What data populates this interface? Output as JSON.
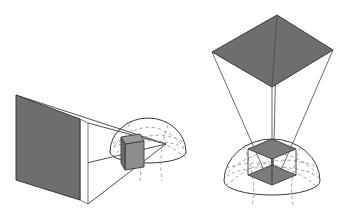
{
  "figure": {
    "background_color": "#ffffff",
    "width": 347,
    "height": 213,
    "panels": [
      {
        "id": "left-panel",
        "name": "side-view-frustum",
        "caption": "",
        "description": "Side view: image plane at left, viewing frustum converging right into a hemispherical scene volume containing a small box.",
        "image_plane": {
          "name": "image-plane-quad",
          "fill": "#6e6e6e",
          "stroke": "#3a3a3a",
          "points": "16,95 80,119 80,200 16,180"
        },
        "image_plane_edge": {
          "name": "image-plane-thickness",
          "fill": "#fbfbfb",
          "stroke": "#555555",
          "points": "80,119 88,123 88,204 80,200"
        },
        "apex": {
          "name": "frustum-apex",
          "x": 166,
          "y": 144
        },
        "frustum_rays": [
          {
            "name": "frustum-ray-top-left",
            "x1": 16,
            "y1": 95,
            "x2": 166,
            "y2": 144
          },
          {
            "name": "frustum-ray-top-right",
            "x1": 88,
            "y1": 123,
            "x2": 166,
            "y2": 144
          },
          {
            "name": "frustum-ray-bot-left",
            "x1": 16,
            "y1": 180,
            "x2": 166,
            "y2": 144
          },
          {
            "name": "frustum-ray-bot-right",
            "x1": 88,
            "y1": 204,
            "x2": 166,
            "y2": 144
          }
        ],
        "hemisphere": {
          "name": "scene-hemisphere",
          "stroke": "#3a3a3a",
          "dash_stroke": "#8a8a8a",
          "center_x": 148,
          "center_y": 152,
          "radius_x": 38,
          "radius_y": 34,
          "base_ellipse_ry": 11
        },
        "box": {
          "name": "scene-box",
          "fill": "#7b7b7b",
          "stroke": "#3a3a3a",
          "top_face": "121,137 140,134 144,141 125,144",
          "front_face": "121,137 125,144 125,170 121,163",
          "side_face": "125,144 144,141 144,167 125,170"
        }
      },
      {
        "id": "right-panel",
        "name": "top-view-frustum",
        "caption": "",
        "description": "Top-down view: image plane above, rays converging down onto a hemispherical scene volume containing an upright box.",
        "image_plane": {
          "name": "image-plane-quad",
          "fill": "#6e6e6e",
          "stroke": "#3a3a3a",
          "points": "277,15 333,50 272,87 212,52"
        },
        "apex": {
          "name": "frustum-apex",
          "x": 272,
          "y": 185
        },
        "frustum_rays": [
          {
            "name": "frustum-ray-corner-top",
            "x1": 277,
            "y1": 15,
            "x2": 273,
            "y2": 184
          },
          {
            "name": "frustum-ray-corner-right",
            "x1": 333,
            "y1": 50,
            "x2": 275,
            "y2": 184
          },
          {
            "name": "frustum-ray-corner-bottom",
            "x1": 272,
            "y1": 87,
            "x2": 272,
            "y2": 184
          },
          {
            "name": "frustum-ray-corner-left",
            "x1": 212,
            "y1": 52,
            "x2": 270,
            "y2": 184
          }
        ],
        "hemisphere": {
          "name": "scene-hemisphere",
          "stroke": "#3a3a3a",
          "dash_stroke": "#8a8a8a",
          "center_x": 272,
          "center_y": 181,
          "radius_x": 48,
          "radius_y": 42,
          "base_ellipse_ry": 14
        },
        "box": {
          "name": "scene-box",
          "fill": "#7b7b7b",
          "stroke": "#3a3a3a",
          "top_face": "272,139 296,149 272,159 248,149",
          "bottom_face": "272,165 296,175 272,185 248,175",
          "left_edge": {
            "x1": 248,
            "y1": 149,
            "x2": 248,
            "y2": 175
          },
          "right_edge": {
            "x1": 296,
            "y1": 149,
            "x2": 296,
            "y2": 175
          },
          "front_edge": {
            "x1": 272,
            "y1": 159,
            "x2": 272,
            "y2": 185
          },
          "back_edge": {
            "x1": 272,
            "y1": 139,
            "x2": 272,
            "y2": 165
          }
        }
      }
    ],
    "colors": {
      "plane_fill": "#6e6e6e",
      "box_fill": "#7b7b7b",
      "line": "#3a3a3a",
      "dashed_line": "#8a8a8a",
      "highlight_edge": "#fbfbfb"
    }
  }
}
